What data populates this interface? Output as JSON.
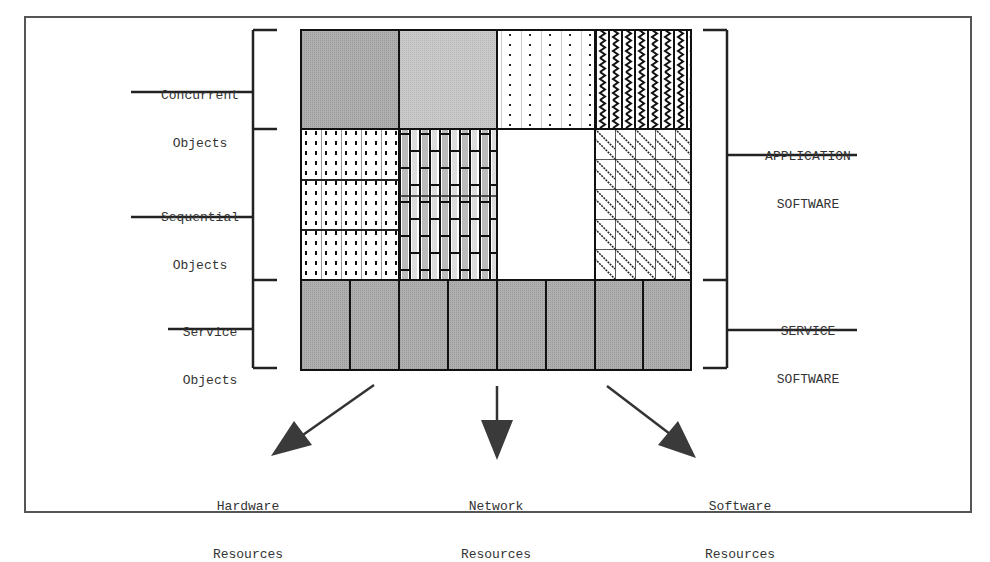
{
  "diagram": {
    "left_labels": [
      {
        "line1": "Concurrent",
        "line2": "Objects"
      },
      {
        "line1": "Sequential",
        "line2": "Objects"
      },
      {
        "line1": "Service",
        "line2": "Objects"
      }
    ],
    "right_labels": [
      {
        "line1": "APPLICATION",
        "line2": "SOFTWARE"
      },
      {
        "line1": "SERVICE",
        "line2": "SOFTWARE"
      }
    ],
    "bottom_labels": [
      {
        "line1": "Hardware",
        "line2": "Resources"
      },
      {
        "line1": "Network",
        "line2": "Resources"
      },
      {
        "line1": "Software",
        "line2": "Resources"
      }
    ],
    "grid": {
      "rows": [
        "concurrent",
        "sequential",
        "service"
      ],
      "columns": 4,
      "service_cells": 8
    },
    "colors": {
      "frame": "#555555",
      "line": "#222222",
      "dark_gray": "#a6a6a6",
      "light_gray": "#c4c4c4",
      "arrow": "#3a3a3a"
    }
  }
}
